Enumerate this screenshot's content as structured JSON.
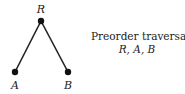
{
  "tree": {
    "nodes": [
      {
        "id": "R",
        "label": "R",
        "x": 41,
        "y": 21,
        "label_x": 41,
        "label_y": 13
      },
      {
        "id": "A",
        "label": "A",
        "x": 15,
        "y": 72,
        "label_x": 15,
        "label_y": 89
      },
      {
        "id": "B",
        "label": "B",
        "x": 68,
        "y": 72,
        "label_x": 68,
        "label_y": 89
      }
    ],
    "edges": [
      {
        "from": "R",
        "to": "A"
      },
      {
        "from": "R",
        "to": "B"
      }
    ]
  },
  "caption": {
    "title": "Preorder traversal",
    "sequence": "R, A, B"
  }
}
